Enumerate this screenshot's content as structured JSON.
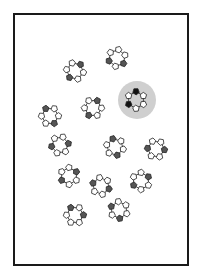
{
  "figure": {
    "width": 200,
    "height": 279,
    "background": "#ffffff",
    "frame": {
      "x": 14,
      "y": 14,
      "w": 174,
      "h": 251,
      "stroke": "#1a1a1a",
      "stroke_width": 2
    },
    "colors": {
      "pentagon_fill": "#ffffff",
      "pentagon_stroke": "#222222",
      "dark_fill": "#555555",
      "highlight_dark_fill": "#111111",
      "highlight_circle": "#cfcfcf",
      "bond": "#222222"
    },
    "highlight": {
      "cx": 137,
      "cy": 100,
      "r": 19
    },
    "clusters": [
      {
        "cx": 75,
        "cy": 71,
        "rot": 10,
        "dark": [
          2,
          5
        ]
      },
      {
        "cx": 117,
        "cy": 58,
        "rot": -20,
        "dark": [
          1,
          3
        ]
      },
      {
        "cx": 136,
        "cy": 100,
        "rot": 30,
        "dark": [
          2,
          4
        ],
        "highlighted": true
      },
      {
        "cx": 50,
        "cy": 116,
        "rot": 0,
        "dark": [
          1,
          4
        ]
      },
      {
        "cx": 93,
        "cy": 108,
        "rot": 60,
        "dark": [
          1,
          4
        ]
      },
      {
        "cx": 60,
        "cy": 145,
        "rot": -10,
        "dark": [
          0,
          3
        ]
      },
      {
        "cx": 115,
        "cy": 147,
        "rot": 15,
        "dark": [
          1,
          4
        ]
      },
      {
        "cx": 156,
        "cy": 149,
        "rot": 5,
        "dark": [
          0,
          3
        ]
      },
      {
        "cx": 69,
        "cy": 176,
        "rot": 90,
        "dark": [
          1,
          4
        ]
      },
      {
        "cx": 101,
        "cy": 186,
        "rot": 20,
        "dark": [
          0,
          3
        ]
      },
      {
        "cx": 141,
        "cy": 181,
        "rot": -30,
        "dark": [
          0,
          3
        ]
      },
      {
        "cx": 75,
        "cy": 215,
        "rot": 0,
        "dark": [
          0,
          4
        ]
      },
      {
        "cx": 119,
        "cy": 210,
        "rot": 25,
        "dark": [
          1,
          3
        ]
      }
    ]
  }
}
